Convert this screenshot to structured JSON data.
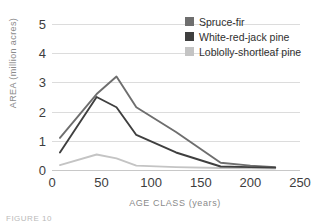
{
  "chart_data": {
    "type": "line",
    "title": "",
    "xlabel": "AGE CLASS (years)",
    "ylabel": "AREA (million acres)",
    "xlim": [
      0,
      250
    ],
    "ylim": [
      0,
      5
    ],
    "xticks": [
      0,
      50,
      100,
      150,
      200,
      250
    ],
    "yticks": [
      0,
      1,
      2,
      3,
      4,
      5
    ],
    "grid": "horizontal",
    "legend_position": "top-right",
    "series": [
      {
        "name": "Spruce-fir",
        "color": "#6e6e6e",
        "x": [
          8,
          45,
          65,
          85,
          125,
          170,
          200,
          225
        ],
        "values": [
          1.1,
          2.6,
          3.2,
          2.15,
          1.3,
          0.25,
          0.15,
          0.1
        ]
      },
      {
        "name": "White-red-jack pine",
        "color": "#3f3f3f",
        "x": [
          8,
          45,
          65,
          85,
          125,
          170,
          200,
          225
        ],
        "values": [
          0.6,
          2.5,
          2.15,
          1.2,
          0.6,
          0.12,
          0.1,
          0.08
        ]
      },
      {
        "name": "Loblolly-shortleaf pine",
        "color": "#c4c4c4",
        "x": [
          8,
          45,
          65,
          85,
          125,
          170,
          200,
          225
        ],
        "values": [
          0.17,
          0.53,
          0.4,
          0.15,
          0.1,
          0.07,
          0.06,
          0.05
        ]
      }
    ]
  },
  "legend": {
    "items": [
      {
        "label": "Spruce-fir",
        "color": "#6e6e6e"
      },
      {
        "label": "White-red-jack pine",
        "color": "#3f3f3f"
      },
      {
        "label": "Loblolly-shortleaf pine",
        "color": "#c4c4c4"
      }
    ]
  },
  "axes": {
    "y_title": "AREA (million acres)",
    "x_title": "AGE CLASS (years)",
    "yticks": [
      "0",
      "1",
      "2",
      "3",
      "4",
      "5"
    ],
    "xticks": [
      "0",
      "50",
      "100",
      "150",
      "200",
      "250"
    ]
  },
  "caption": "FIGURE 10"
}
